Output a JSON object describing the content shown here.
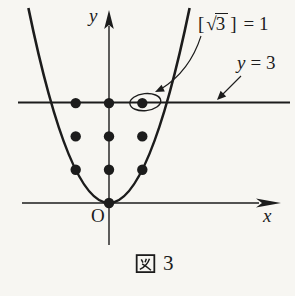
{
  "figure": {
    "background": "#f7f6f2",
    "ink": "#1c1c1c",
    "axes": {
      "x_label": "x",
      "y_label": "y",
      "origin_label": "O"
    },
    "line_y3": {
      "y_value": 3,
      "label_var": "y",
      "label_rest": "= 3"
    },
    "floor_annotation": {
      "open": "[",
      "radical": "√",
      "radicand": "3",
      "close": "]",
      "rest": "= 1"
    },
    "lattice_points": [
      [
        -1,
        3
      ],
      [
        0,
        3
      ],
      [
        1,
        3
      ],
      [
        -1,
        2
      ],
      [
        0,
        2
      ],
      [
        1,
        2
      ],
      [
        -1,
        1
      ],
      [
        0,
        1
      ],
      [
        1,
        1
      ],
      [
        0,
        0
      ]
    ],
    "circled_point": [
      1,
      3
    ],
    "caption": {
      "kanji": "図",
      "number": "3",
      "full": "図 3"
    }
  }
}
